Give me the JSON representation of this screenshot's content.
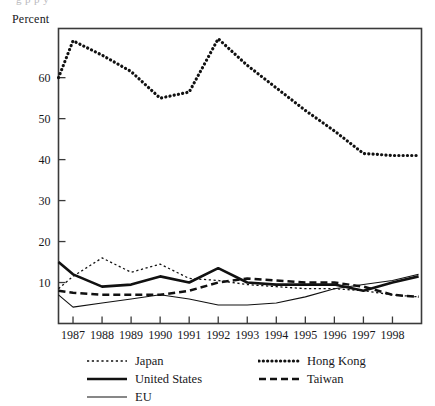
{
  "figure": {
    "y_axis_title": "Percent",
    "cropped_title_fragment": "g                     p                                                        p y"
  },
  "chart_data": {
    "type": "line",
    "title": "",
    "subtitle": "",
    "xlabel": "",
    "ylabel": "Percent",
    "ylim": [
      0,
      72
    ],
    "xlim": [
      1986.5,
      1999.0
    ],
    "grid": false,
    "legend_position": "below-left",
    "y_ticks": [
      10,
      20,
      30,
      40,
      50,
      60
    ],
    "x_ticks": [
      1987,
      1988,
      1989,
      1990,
      1991,
      1992,
      1993,
      1994,
      1995,
      1996,
      1997,
      1998
    ],
    "x_tick_labels": [
      "1987",
      "1988",
      "1989",
      "1990",
      "1991",
      "1992",
      "1993",
      "1994",
      "1995",
      "1996",
      "1997",
      "1998"
    ],
    "x": [
      1986.5,
      1987,
      1988,
      1989,
      1990,
      1991,
      1992,
      1993,
      1994,
      1995,
      1996,
      1997,
      1998,
      1998.9
    ],
    "series": [
      {
        "name": "Hong Kong",
        "style": "thick-dotted",
        "color": "#111111",
        "values": [
          60.0,
          69.0,
          65.5,
          61.5,
          55.0,
          56.5,
          69.5,
          63.0,
          57.5,
          52.0,
          47.0,
          41.5,
          41.0,
          41.0
        ]
      },
      {
        "name": "Japan",
        "style": "fine-dotted",
        "color": "#111111",
        "values": [
          8.5,
          11.5,
          16.0,
          12.5,
          14.5,
          11.0,
          10.5,
          9.5,
          9.0,
          8.5,
          8.5,
          8.0,
          7.0,
          6.5
        ]
      },
      {
        "name": "United States",
        "style": "thick-solid",
        "color": "#111111",
        "values": [
          15.0,
          12.0,
          9.0,
          9.5,
          11.5,
          10.0,
          13.5,
          10.0,
          9.5,
          9.5,
          9.5,
          8.0,
          10.0,
          11.5
        ]
      },
      {
        "name": "Taiwan",
        "style": "dashed",
        "color": "#111111",
        "values": [
          8.0,
          7.5,
          7.0,
          7.0,
          7.0,
          8.0,
          10.0,
          11.0,
          10.5,
          10.0,
          10.0,
          9.0,
          7.0,
          6.5
        ]
      },
      {
        "name": "EU",
        "style": "thin-solid",
        "color": "#111111",
        "values": [
          7.0,
          4.0,
          5.0,
          6.0,
          7.0,
          6.0,
          4.5,
          4.5,
          5.0,
          6.5,
          8.5,
          9.5,
          10.5,
          12.0
        ]
      }
    ]
  },
  "legend": {
    "left_column": [
      {
        "label": "Japan",
        "style": "fine-dotted"
      },
      {
        "label": "United States",
        "style": "thick-solid"
      },
      {
        "label": "EU",
        "style": "thin-solid"
      }
    ],
    "right_column": [
      {
        "label": "Hong Kong",
        "style": "thick-dotted"
      },
      {
        "label": "Taiwan",
        "style": "dashed"
      }
    ]
  }
}
